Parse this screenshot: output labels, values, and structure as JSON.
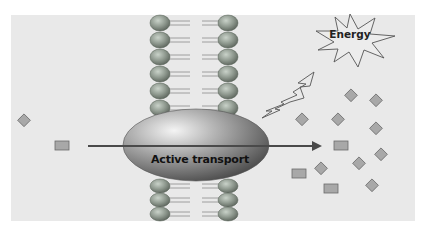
{
  "diagram": {
    "labels": {
      "transporter": "Active transport",
      "energy": "Energy"
    },
    "colors": {
      "panel_background": "#e9e9e9",
      "page_background": "#ffffff",
      "lipid_head": "#8f9a8f",
      "transporter": "#7a7a7a",
      "arrow": "#4a4a4a",
      "molecule_fill": "#a8a8a8",
      "molecule_stroke": "#6a6a6a",
      "energy_star_fill": "#ececec",
      "energy_star_stroke": "#555555"
    },
    "membrane": {
      "left_head_x": 160,
      "right_head_x": 228,
      "top_heads_y": [
        23,
        40,
        57,
        74,
        91,
        108
      ],
      "bottom_heads_y": [
        186,
        200,
        214
      ]
    },
    "transport_arrow": {
      "from_x": 88,
      "to_x": 320,
      "y": 146,
      "direction": "left-to-right"
    },
    "molecules": {
      "outside_left": [
        {
          "shape": "diamond",
          "x": 24,
          "y": 121
        },
        {
          "shape": "rectangle",
          "x": 62,
          "y": 146
        }
      ],
      "inside_right": [
        {
          "shape": "diamond",
          "x": 351,
          "y": 96
        },
        {
          "shape": "diamond",
          "x": 376,
          "y": 101
        },
        {
          "shape": "diamond",
          "x": 302,
          "y": 120
        },
        {
          "shape": "diamond",
          "x": 338,
          "y": 120
        },
        {
          "shape": "diamond",
          "x": 376,
          "y": 129
        },
        {
          "shape": "rectangle",
          "x": 340,
          "y": 145
        },
        {
          "shape": "diamond",
          "x": 381,
          "y": 155
        },
        {
          "shape": "diamond",
          "x": 359,
          "y": 164
        },
        {
          "shape": "diamond",
          "x": 321,
          "y": 169
        },
        {
          "shape": "rectangle",
          "x": 298,
          "y": 173
        },
        {
          "shape": "rectangle",
          "x": 330,
          "y": 188
        },
        {
          "shape": "diamond",
          "x": 372,
          "y": 186
        }
      ]
    }
  }
}
